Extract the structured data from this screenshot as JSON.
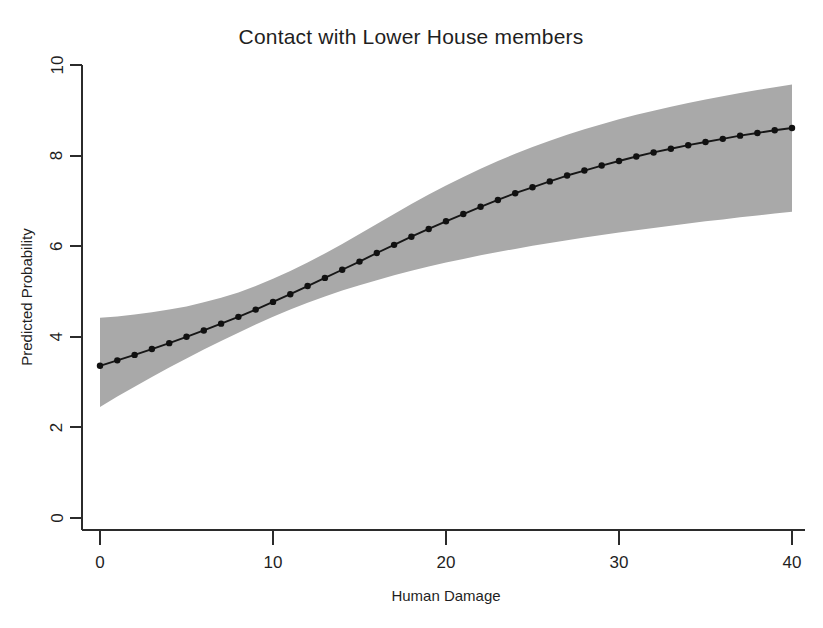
{
  "chart_data": {
    "type": "line",
    "title": "Contact with Lower House members",
    "subtitle": "",
    "xlabel": "Human Damage",
    "ylabel": "Predicted Probability",
    "xlim": [
      0,
      40
    ],
    "ylim": [
      0,
      10
    ],
    "xticks": [
      0,
      10,
      20,
      30,
      40
    ],
    "yticks": [
      0,
      2,
      4,
      6,
      8,
      10
    ],
    "xtick_labels": [
      "0",
      "10",
      "20",
      "30",
      "40"
    ],
    "ytick_labels": [
      "0",
      "2",
      "4",
      "6",
      "8",
      "10"
    ],
    "grid": false,
    "legend": null,
    "legend_position": "none",
    "marker": "filled-circle",
    "band_label": "confidence interval",
    "band_color": "#a9a9a9",
    "line_color": "#171717",
    "x": [
      0,
      1,
      2,
      3,
      4,
      5,
      6,
      7,
      8,
      9,
      10,
      11,
      12,
      13,
      14,
      15,
      16,
      17,
      18,
      19,
      20,
      21,
      22,
      23,
      24,
      25,
      26,
      27,
      28,
      29,
      30,
      31,
      32,
      33,
      34,
      35,
      36,
      37,
      38,
      39,
      40
    ],
    "series": [
      {
        "name": "Predicted Probability",
        "values": [
          3.36,
          3.48,
          3.6,
          3.73,
          3.86,
          4.0,
          4.14,
          4.29,
          4.44,
          4.6,
          4.77,
          4.94,
          5.12,
          5.3,
          5.48,
          5.66,
          5.85,
          6.03,
          6.21,
          6.38,
          6.55,
          6.71,
          6.87,
          7.02,
          7.17,
          7.3,
          7.43,
          7.56,
          7.67,
          7.78,
          7.88,
          7.98,
          8.07,
          8.15,
          8.23,
          8.3,
          8.37,
          8.44,
          8.5,
          8.56,
          8.61
        ],
        "ci_lower": [
          2.45,
          2.68,
          2.9,
          3.11,
          3.32,
          3.52,
          3.72,
          3.91,
          4.09,
          4.27,
          4.44,
          4.6,
          4.75,
          4.89,
          5.02,
          5.14,
          5.25,
          5.36,
          5.46,
          5.55,
          5.64,
          5.72,
          5.8,
          5.87,
          5.94,
          6.01,
          6.07,
          6.13,
          6.19,
          6.25,
          6.3,
          6.35,
          6.4,
          6.45,
          6.5,
          6.55,
          6.59,
          6.64,
          6.68,
          6.72,
          6.76
        ],
        "ci_upper": [
          4.42,
          4.45,
          4.49,
          4.54,
          4.6,
          4.67,
          4.76,
          4.86,
          4.98,
          5.12,
          5.28,
          5.45,
          5.64,
          5.84,
          6.05,
          6.27,
          6.49,
          6.71,
          6.93,
          7.14,
          7.34,
          7.53,
          7.71,
          7.88,
          8.04,
          8.19,
          8.33,
          8.46,
          8.58,
          8.69,
          8.8,
          8.9,
          8.99,
          9.08,
          9.16,
          9.24,
          9.31,
          9.38,
          9.45,
          9.51,
          9.57
        ]
      }
    ]
  },
  "figure": {
    "background_color": "#ffffff",
    "axis_color": "#2b2b2b"
  }
}
